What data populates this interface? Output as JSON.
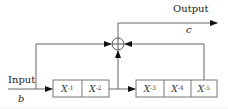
{
  "diagram": {
    "input": {
      "label": "Input",
      "signal": "b"
    },
    "output": {
      "label": "Output",
      "signal": "c"
    },
    "adder": {
      "symbol": "plus-circle"
    },
    "delay_block_1": {
      "cells": [
        {
          "base": "X",
          "exp": "-1"
        },
        {
          "base": "X",
          "exp": "-2"
        }
      ]
    },
    "delay_block_2": {
      "cells": [
        {
          "base": "X",
          "exp": "-3"
        },
        {
          "base": "X",
          "exp": "-4"
        },
        {
          "base": "X",
          "exp": "-5"
        }
      ]
    },
    "colors": {
      "line": "#555555",
      "box_border": "#777777",
      "text": "#222222"
    }
  }
}
